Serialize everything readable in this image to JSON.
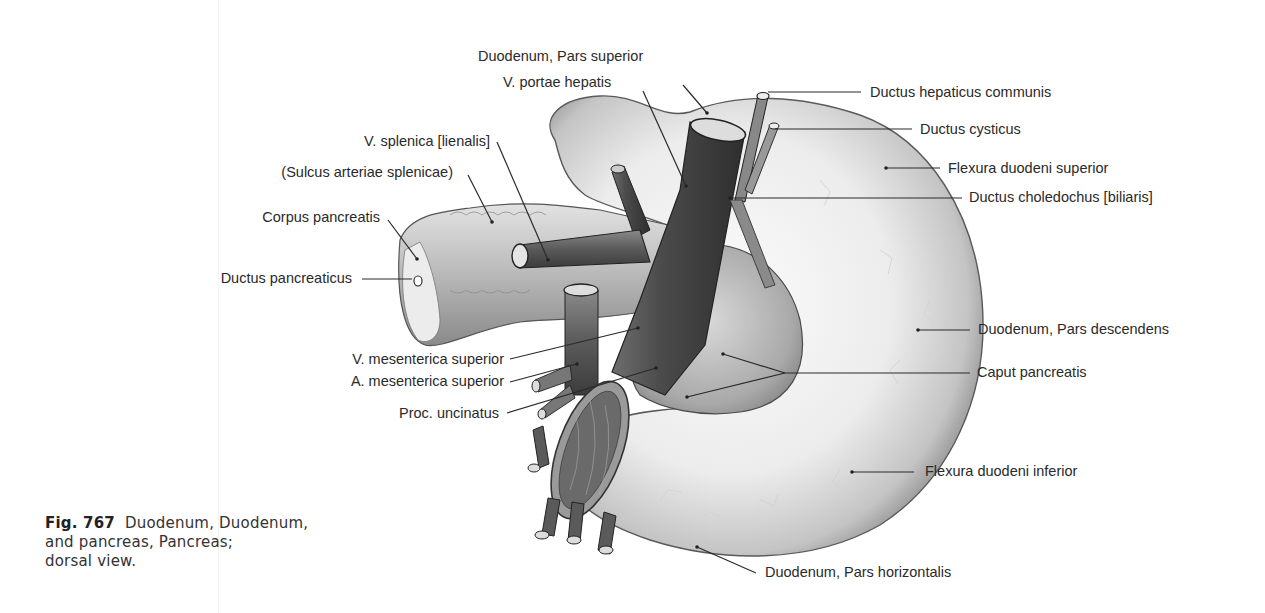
{
  "figure": {
    "number": "Fig. 767",
    "caption_line1": "Duodenum, Duodenum,",
    "caption_line2": "and pancreas, Pancreas;",
    "caption_line3": "dorsal view."
  },
  "labels": {
    "left": [
      {
        "id": "v-splenica",
        "text": "V. splenica [lienalis]"
      },
      {
        "id": "sulcus-arteriae-splenicae",
        "text": "(Sulcus arteriae splenicae)"
      },
      {
        "id": "corpus-pancreatis",
        "text": "Corpus pancreatis"
      },
      {
        "id": "ductus-pancreaticus",
        "text": "Ductus pancreaticus"
      },
      {
        "id": "v-mesenterica-superior",
        "text": "V. mesenterica superior"
      },
      {
        "id": "a-mesenterica-superior",
        "text": "A. mesenterica superior"
      },
      {
        "id": "proc-uncinatus",
        "text": "Proc. uncinatus"
      }
    ],
    "top": [
      {
        "id": "duodenum-pars-superior",
        "text": "Duodenum, Pars superior"
      },
      {
        "id": "v-portae-hepatis",
        "text": "V. portae hepatis"
      }
    ],
    "right": [
      {
        "id": "ductus-hepaticus-communis",
        "text": "Ductus hepaticus communis"
      },
      {
        "id": "ductus-cysticus",
        "text": "Ductus cysticus"
      },
      {
        "id": "flexura-duodeni-superior",
        "text": "Flexura duodeni superior"
      },
      {
        "id": "ductus-choledochus",
        "text": "Ductus choledochus [biliaris]"
      },
      {
        "id": "duodenum-pars-descendens",
        "text": "Duodenum, Pars descendens"
      },
      {
        "id": "caput-pancreatis",
        "text": "Caput pancreatis"
      },
      {
        "id": "flexura-duodeni-inferior",
        "text": "Flexura duodeni inferior"
      },
      {
        "id": "duodenum-pars-horizontalis",
        "text": "Duodenum, Pars horizontalis"
      }
    ]
  }
}
